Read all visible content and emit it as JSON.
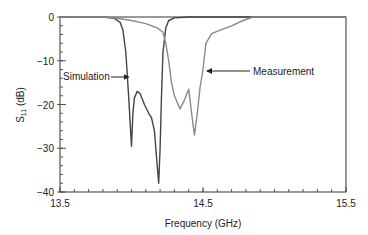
{
  "chart_data": {
    "type": "line",
    "title": "",
    "xlabel": "Frequency (GHz)",
    "ylabel": "S11 (dB)",
    "ylabel_main": "S",
    "ylabel_sub": "11",
    "ylabel_unit": " (dB)",
    "xlim": [
      13.5,
      15.5
    ],
    "ylim": [
      -40,
      0
    ],
    "xticks": [
      13.5,
      14.5,
      15.5
    ],
    "xtick_labels": [
      "13.5",
      "14.5",
      "15.5"
    ],
    "x_minor_step": 0.1,
    "yticks": [
      0,
      -10,
      -20,
      -30,
      -40
    ],
    "ytick_labels": [
      "0",
      "−10",
      "−20",
      "−30",
      "−40"
    ],
    "y_minor_step": 2,
    "grid": false,
    "legend": "annotations",
    "series": [
      {
        "name": "Simulation",
        "color": "#444444",
        "x": [
          13.5,
          13.8,
          13.88,
          13.92,
          13.94,
          13.96,
          13.98,
          14.0,
          14.01,
          14.02,
          14.04,
          14.06,
          14.09,
          14.12,
          14.14,
          14.16,
          14.18,
          14.19,
          14.2,
          14.21,
          14.22,
          14.24,
          14.26,
          14.3,
          14.4,
          15.5
        ],
        "values": [
          0,
          0,
          -0.3,
          -1.2,
          -3,
          -8,
          -18,
          -29.5,
          -22,
          -18.5,
          -17,
          -17.5,
          -20,
          -22,
          -23,
          -26,
          -34,
          -38,
          -30,
          -18,
          -8,
          -2.5,
          -0.8,
          -0.2,
          0,
          0
        ]
      },
      {
        "name": "Measurement",
        "color": "#8a8a8a",
        "x": [
          13.5,
          13.8,
          13.9,
          14.0,
          14.1,
          14.18,
          14.22,
          14.24,
          14.26,
          14.28,
          14.3,
          14.34,
          14.37,
          14.4,
          14.42,
          14.44,
          14.46,
          14.48,
          14.5,
          14.52,
          14.56,
          14.62,
          14.7,
          14.78,
          14.85,
          15.5
        ],
        "values": [
          0,
          0,
          -0.3,
          -0.8,
          -1.5,
          -2.5,
          -3.5,
          -6,
          -10,
          -15,
          -18,
          -21,
          -19,
          -16.5,
          -22,
          -27,
          -22,
          -16,
          -12,
          -6,
          -3.8,
          -3,
          -2,
          -0.8,
          0,
          0
        ]
      }
    ],
    "annotations": [
      {
        "text": "Simulation",
        "arrow_to": [
          14.0,
          -15
        ]
      },
      {
        "text": "Measurement",
        "arrow_to": [
          14.5,
          -12
        ]
      }
    ]
  }
}
